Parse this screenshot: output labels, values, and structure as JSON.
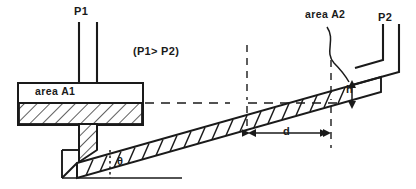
{
  "diagram": {
    "labels": {
      "p1": "P1",
      "p2": "P2",
      "pressure_relation": "(P1> P2)",
      "area_a1": "area A1",
      "area_a2": "area A2",
      "distance_d": "d",
      "height_h": "h",
      "angle_theta": "θ"
    },
    "icons": {
      "piston_hatch": "hatch-pattern-icon",
      "wedge_hatch": "hatch-pattern-icon",
      "dimension_arrow_left": "arrow-left-icon",
      "dimension_arrow_right": "arrow-right-icon",
      "dimension_arrow_up": "arrow-up-icon",
      "dimension_arrow_down": "arrow-down-icon",
      "leader_line": "leader-curve-icon"
    },
    "colors": {
      "stroke": "#1a1a1a",
      "background": "#ffffff",
      "fill": "#ffffff"
    }
  }
}
